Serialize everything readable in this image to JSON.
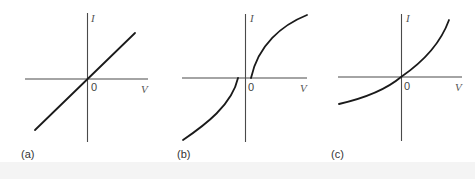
{
  "figure": {
    "panels": [
      {
        "id": "a",
        "label": "(a)",
        "y_axis_label": "I",
        "x_axis_label": "V",
        "origin_label": "0",
        "curve_shape": "linear through origin (ohmic)"
      },
      {
        "id": "b",
        "label": "(b)",
        "y_axis_label": "I",
        "x_axis_label": "V",
        "origin_label": "0",
        "curve_shape": "two branches with threshold offsets on either side of origin, concave"
      },
      {
        "id": "c",
        "label": "(c)",
        "y_axis_label": "I",
        "x_axis_label": "V",
        "origin_label": "0",
        "curve_shape": "nonlinear through origin, increasing slope (exponential-like)"
      }
    ]
  },
  "colors": {
    "curve": "#1a1a1a",
    "axis": "#4a4a4a",
    "background": "#ffffff"
  }
}
